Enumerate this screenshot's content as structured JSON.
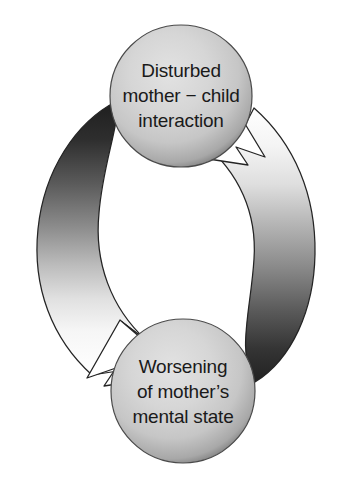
{
  "diagram": {
    "type": "cycle-diagram",
    "background_color": "#ffffff",
    "nodes": [
      {
        "id": "node-top",
        "name": "disturbed-interaction-node",
        "lines": [
          "Disturbed",
          "mother − child",
          "interaction"
        ],
        "center_x": 181,
        "center_y": 96,
        "radius": 71,
        "fill_light": "#dcdcdc",
        "fill_mid": "#c8c8c8",
        "fill_dark": "#6e6e6e",
        "text_color": "#1a1a1a"
      },
      {
        "id": "node-bottom",
        "name": "worsening-mental-state-node",
        "lines": [
          "Worsening",
          "of mother’s",
          "mental state"
        ],
        "center_x": 183,
        "center_y": 391,
        "radius": 72,
        "fill_light": "#dcdcdc",
        "fill_mid": "#c8c8c8",
        "fill_dark": "#6e6e6e",
        "text_color": "#1a1a1a"
      }
    ],
    "arrows": [
      {
        "id": "arrow-left",
        "name": "arrow-top-to-bottom",
        "from": "node-top",
        "to": "node-bottom",
        "side": "left",
        "direction": "downward",
        "head_position": "bottom-left",
        "gradient_from": "#2a2a2a",
        "gradient_to": "#ffffff",
        "outline_color": "#1a1a1a"
      },
      {
        "id": "arrow-right",
        "name": "arrow-bottom-to-top",
        "from": "node-bottom",
        "to": "node-top",
        "side": "right",
        "direction": "upward",
        "head_position": "top-right",
        "gradient_from": "#ffffff",
        "gradient_to": "#2a2a2a",
        "outline_color": "#1a1a1a"
      }
    ]
  }
}
